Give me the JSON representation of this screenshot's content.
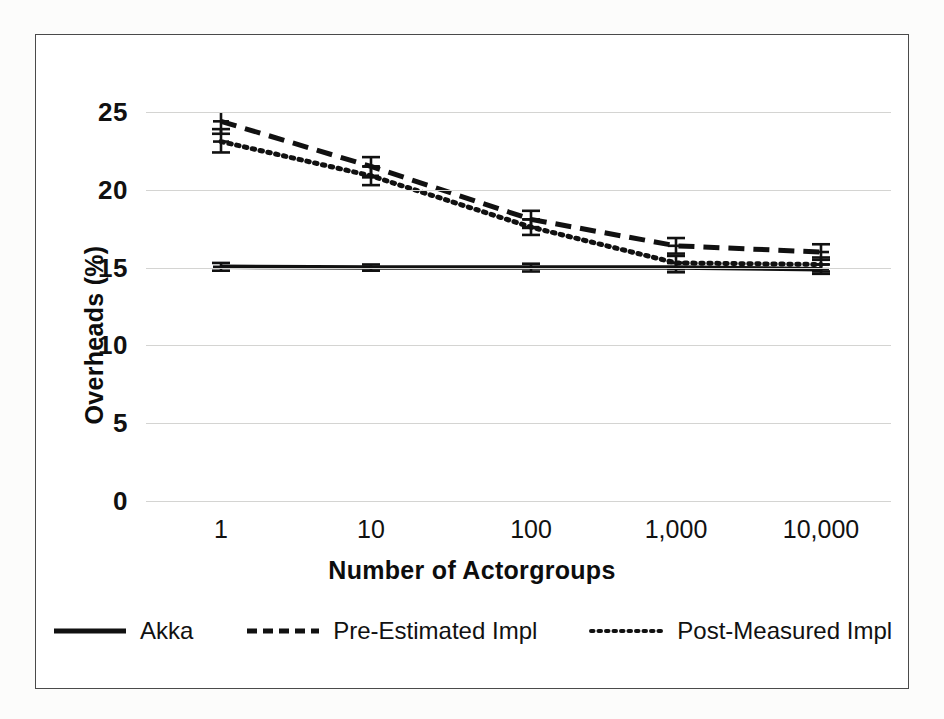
{
  "chart_data": {
    "type": "line",
    "title": "",
    "xlabel": "Number of Actorgroups",
    "ylabel": "Overheads (%)",
    "x_tick_labels": [
      "1",
      "10",
      "100",
      "1,000",
      "10,000"
    ],
    "x_scale": "categorical-log",
    "y_ticks": [
      0,
      5,
      10,
      15,
      20,
      25
    ],
    "ylim": [
      0,
      25
    ],
    "grid": "horizontal",
    "legend_position": "bottom",
    "error_bars": true,
    "series": [
      {
        "name": "Akka",
        "style": "solid",
        "color": "#111111",
        "values": [
          15.05,
          15.0,
          15.0,
          15.0,
          14.9
        ],
        "err_low": [
          0.25,
          0.2,
          0.25,
          0.3,
          0.3
        ],
        "err_high": [
          0.25,
          0.2,
          0.25,
          0.3,
          0.3
        ]
      },
      {
        "name": "Pre-Estimated Impl",
        "style": "dashed",
        "color": "#111111",
        "values": [
          24.4,
          21.5,
          18.1,
          16.4,
          16.0
        ],
        "err_low": [
          0.8,
          0.7,
          0.55,
          0.5,
          0.5
        ],
        "err_high": [
          0.7,
          0.6,
          0.55,
          0.5,
          0.5
        ]
      },
      {
        "name": "Post-Measured Impl",
        "style": "dotted",
        "color": "#111111",
        "values": [
          23.1,
          20.9,
          17.6,
          15.3,
          15.2
        ],
        "err_low": [
          0.7,
          0.6,
          0.5,
          0.4,
          0.45
        ],
        "err_high": [
          0.8,
          0.6,
          0.5,
          0.45,
          0.45
        ]
      }
    ]
  },
  "axis": {
    "y_title": "Overheads (%)",
    "x_title": "Number of Actorgroups",
    "y_tick_labels": [
      "25",
      "20",
      "15",
      "10",
      "5",
      "0"
    ],
    "x_tick_labels": [
      "1",
      "10",
      "100",
      "1,000",
      "10,000"
    ]
  },
  "legend": {
    "items": [
      {
        "label": "Akka",
        "style": "solid"
      },
      {
        "label": "Pre-Estimated Impl",
        "style": "dashed"
      },
      {
        "label": "Post-Measured Impl",
        "style": "dotted"
      }
    ]
  },
  "colors": {
    "line": "#111111",
    "grid": "#d4d4d2",
    "frame": "#4a4a4a",
    "background": "#ffffff"
  }
}
